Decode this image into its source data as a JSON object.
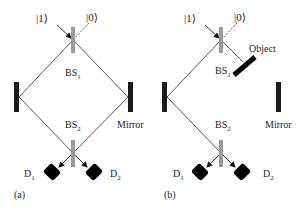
{
  "diagram": {
    "colors": {
      "beam": "#444444",
      "mirror": "#1a1a1a",
      "splitter": "#9a9a9a",
      "detector": "#000000",
      "text": "#222222"
    },
    "panels": [
      {
        "id": "a",
        "caption": "(a)",
        "input_labels": {
          "one": "|1⟩",
          "zero": "|0⟩"
        },
        "bs1": {
          "label": "BS",
          "sub": "1"
        },
        "bs2": {
          "label": "BS",
          "sub": "2"
        },
        "mirror_label": "Mirror",
        "detectors": [
          {
            "label": "D",
            "sub": "1"
          },
          {
            "label": "D",
            "sub": "2"
          }
        ]
      },
      {
        "id": "b",
        "caption": "(b)",
        "input_labels": {
          "one": "|1⟩",
          "zero": "|0⟩"
        },
        "bs1": {
          "label": "BS",
          "sub": "1"
        },
        "bs2": {
          "label": "BS",
          "sub": "2"
        },
        "object_label": "Object",
        "mirror_label": "Mirror",
        "detectors": [
          {
            "label": "D",
            "sub": "1"
          },
          {
            "label": "D",
            "sub": "2"
          }
        ]
      }
    ]
  }
}
